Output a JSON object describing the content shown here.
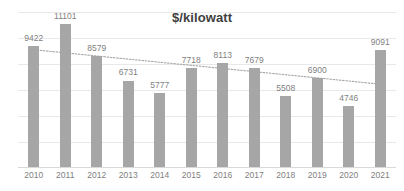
{
  "chart_data": {
    "type": "bar",
    "title": "$/kilowatt",
    "xlabel": "",
    "ylabel": "",
    "categories": [
      "2010",
      "2011",
      "2012",
      "2013",
      "2014",
      "2015",
      "2016",
      "2017",
      "2018",
      "2019",
      "2020",
      "2021"
    ],
    "values": [
      9422,
      11101,
      8579,
      6731,
      5777,
      7718,
      8113,
      7679,
      5508,
      6900,
      4746,
      9091
    ],
    "data_labels": [
      "9422",
      "11101",
      "8579",
      "6731",
      "5777",
      "7718",
      "8113",
      "7679",
      "5508",
      "6900",
      "4746",
      "9091"
    ],
    "ylim": [
      0,
      12000
    ],
    "gridlines": [
      0,
      2000,
      4000,
      6000,
      8000,
      10000,
      12000
    ],
    "grid": true,
    "legend": "none",
    "series": [
      {
        "name": "$/kilowatt",
        "values": [
          9422,
          11101,
          8579,
          6731,
          5777,
          7718,
          8113,
          7679,
          5508,
          6900,
          4746,
          9091
        ],
        "color": "#a6a6a6"
      }
    ],
    "trendline": {
      "type": "linear",
      "style": "dotted",
      "color": "#a6a6a6",
      "start_value": 9100,
      "end_value": 6450
    },
    "colors": {
      "bar": "#a6a6a6",
      "gridline": "#e8e8e8",
      "axis": "#d9d9d9",
      "label_text": "#7f7f7f",
      "title_text": "#404040",
      "background": "#ffffff"
    }
  }
}
